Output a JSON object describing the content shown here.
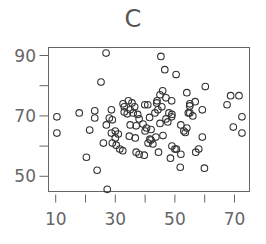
{
  "chart_data": {
    "type": "scatter",
    "title": "C",
    "xlabel": "",
    "ylabel": "",
    "xlim": [
      7,
      75
    ],
    "ylim": [
      44.5,
      93
    ],
    "xticks": [
      10,
      20,
      30,
      40,
      50,
      60,
      70
    ],
    "xtick_labels": [
      "10",
      "",
      "30",
      "",
      "50",
      "",
      "70"
    ],
    "yticks": [
      50,
      60,
      70,
      80,
      90
    ],
    "ytick_labels": [
      "50",
      "",
      "70",
      "",
      "90"
    ],
    "grid": false,
    "legend": null,
    "marker": "open-circle",
    "x": [
      26.9,
      45.3,
      46.6,
      50.4,
      25.2,
      60.2,
      10.4,
      10.4,
      17.9,
      23.1,
      23.1,
      21.4,
      20.3,
      23.9,
      27.3,
      68.7,
      71.5,
      67.5,
      72.5,
      69.6,
      72.5,
      59.2,
      59.9,
      51.8,
      48.5,
      54.0,
      56.8,
      59.2,
      55.0,
      55.0,
      28.7,
      28.0,
      29.0,
      32.6,
      34.4,
      35.6,
      33.0,
      34.0,
      39.9,
      40.9,
      43.3,
      44.3,
      45.6,
      45.9,
      48.9,
      48.9,
      47.6,
      28.7,
      30.0,
      30.3,
      34.7,
      36.7,
      38.0,
      39.7,
      41.6,
      42.6,
      43.6,
      35.0,
      37.0,
      39.3,
      43.9,
      48.0,
      52.0,
      56.0,
      57.0,
      58.0,
      54.0,
      53.0,
      52.0,
      49.0,
      50.0,
      47.0,
      45.0,
      44.0,
      41.0,
      42.0,
      40.0,
      37.0,
      31.0,
      30.0,
      29.0,
      27.0,
      26.0,
      33.0,
      35.0,
      36.0,
      38.0,
      47.0,
      49.0,
      50.5,
      54.5,
      55.0,
      53.5,
      46.0,
      44.5,
      42.0,
      41.5,
      40.5,
      31.5,
      32.5,
      37.5,
      36.5,
      45.0
    ],
    "y": [
      90.8,
      89.7,
      85.3,
      83.7,
      81.2,
      79.7,
      69.7,
      64.3,
      71.0,
      71.7,
      69.3,
      65.3,
      56.3,
      52.0,
      45.7,
      76.7,
      76.7,
      73.7,
      69.7,
      66.3,
      64.3,
      63.0,
      52.7,
      53.0,
      56.0,
      77.7,
      74.7,
      72.0,
      73.3,
      71.0,
      72.0,
      69.3,
      68.7,
      74.0,
      75.0,
      74.3,
      71.3,
      70.7,
      73.7,
      73.7,
      71.0,
      72.0,
      73.0,
      78.3,
      75.0,
      69.7,
      68.0,
      64.3,
      62.7,
      60.3,
      63.3,
      62.7,
      57.3,
      57.0,
      62.3,
      60.7,
      63.0,
      67.0,
      66.7,
      67.3,
      74.3,
      71.0,
      67.0,
      70.0,
      58.0,
      59.0,
      66.0,
      65.0,
      57.3,
      60.0,
      59.0,
      76.0,
      77.0,
      75.0,
      61.0,
      62.0,
      65.0,
      58.0,
      64.0,
      65.0,
      61.0,
      67.0,
      61.0,
      73.0,
      72.0,
      71.0,
      69.0,
      69.0,
      70.5,
      59.0,
      71.0,
      74.0,
      64.5,
      63.5,
      58.0,
      65.5,
      69.5,
      66.0,
      59.0,
      58.5,
      70.5,
      73.0,
      67.5
    ]
  }
}
